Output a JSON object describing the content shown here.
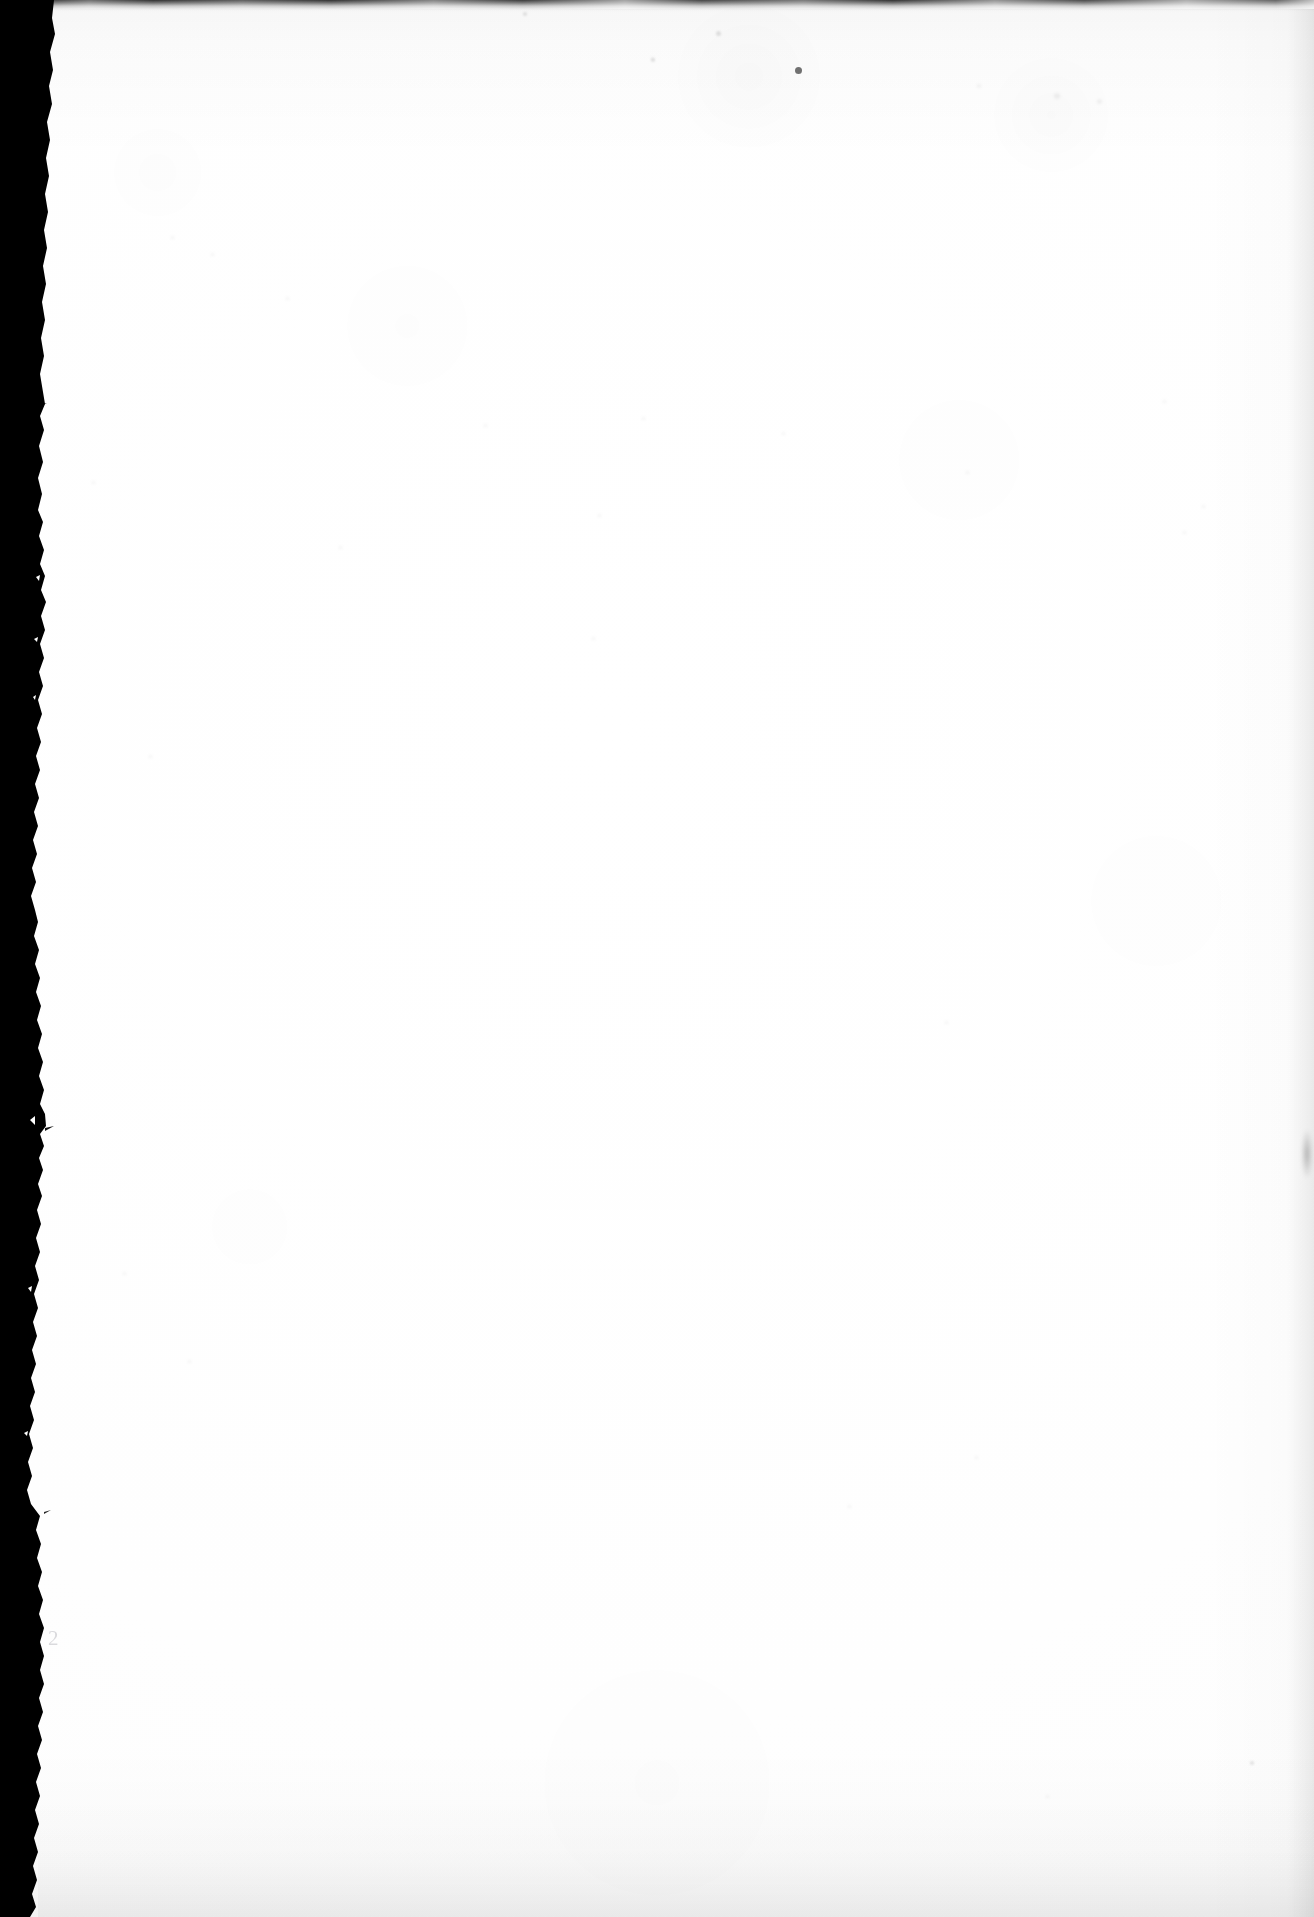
{
  "document": {
    "kind": "scanned-page",
    "page_side": "verso",
    "content_state": "blank",
    "visible_text_count": 1
  },
  "page": {
    "width": 1314,
    "height": 1917,
    "paper_color": "#ffffff",
    "page_number": "2"
  },
  "scan_artifacts": {
    "left_border": {
      "name": "scanner-black-border",
      "color": "#000000",
      "edge": "ragged",
      "width_top": 52,
      "width_middle": 41,
      "width_bottom": 35
    },
    "top_edge": {
      "name": "scanner-top-smudge",
      "color": "#141414",
      "height": 9
    },
    "right_edge": {
      "name": "scanner-right-shadow",
      "color": "#000000",
      "opacity": "0.05"
    },
    "bottom_edge": {
      "name": "scanner-bottom-shadow",
      "color": "#000000",
      "opacity": "0.04"
    }
  },
  "specks": [
    {
      "x": 795,
      "y": 67,
      "size": 7,
      "class": "soft"
    },
    {
      "x": 716,
      "y": 31,
      "size": 5,
      "class": "faint"
    },
    {
      "x": 651,
      "y": 58,
      "size": 4,
      "class": "faint"
    },
    {
      "x": 523,
      "y": 12,
      "size": 4,
      "class": "faint"
    },
    {
      "x": 977,
      "y": 84,
      "size": 4,
      "class": "veryfaint"
    },
    {
      "x": 1054,
      "y": 93,
      "size": 6,
      "class": "veryfaint"
    },
    {
      "x": 1097,
      "y": 99,
      "size": 5,
      "class": "veryfaint"
    },
    {
      "x": 171,
      "y": 236,
      "size": 3,
      "class": "veryfaint"
    },
    {
      "x": 211,
      "y": 253,
      "size": 3,
      "class": "veryfaint"
    },
    {
      "x": 286,
      "y": 297,
      "size": 3,
      "class": "veryfaint"
    },
    {
      "x": 484,
      "y": 424,
      "size": 3,
      "class": "veryfaint"
    },
    {
      "x": 642,
      "y": 417,
      "size": 3,
      "class": "veryfaint"
    },
    {
      "x": 651,
      "y": 57,
      "size": 3,
      "class": "veryfaint"
    },
    {
      "x": 782,
      "y": 432,
      "size": 3,
      "class": "veryfaint"
    },
    {
      "x": 966,
      "y": 471,
      "size": 3,
      "class": "veryfaint"
    },
    {
      "x": 1163,
      "y": 400,
      "size": 3,
      "class": "veryfaint"
    },
    {
      "x": 92,
      "y": 481,
      "size": 3,
      "class": "veryfaint"
    },
    {
      "x": 598,
      "y": 514,
      "size": 3,
      "class": "veryfaint"
    },
    {
      "x": 339,
      "y": 546,
      "size": 3,
      "class": "veryfaint"
    },
    {
      "x": 592,
      "y": 637,
      "size": 3,
      "class": "veryfaint"
    },
    {
      "x": 1183,
      "y": 531,
      "size": 3,
      "class": "veryfaint"
    },
    {
      "x": 1202,
      "y": 505,
      "size": 3,
      "class": "veryfaint"
    },
    {
      "x": 945,
      "y": 1021,
      "size": 3,
      "class": "veryfaint"
    },
    {
      "x": 848,
      "y": 1505,
      "size": 3,
      "class": "veryfaint"
    },
    {
      "x": 975,
      "y": 1456,
      "size": 3,
      "class": "veryfaint"
    },
    {
      "x": 1250,
      "y": 1761,
      "size": 4,
      "class": "faint"
    },
    {
      "x": 1046,
      "y": 1795,
      "size": 3,
      "class": "veryfaint"
    },
    {
      "x": 149,
      "y": 755,
      "size": 3,
      "class": "veryfaint"
    },
    {
      "x": 123,
      "y": 1272,
      "size": 3,
      "class": "veryfaint"
    },
    {
      "x": 188,
      "y": 1360,
      "size": 3,
      "class": "veryfaint"
    }
  ]
}
